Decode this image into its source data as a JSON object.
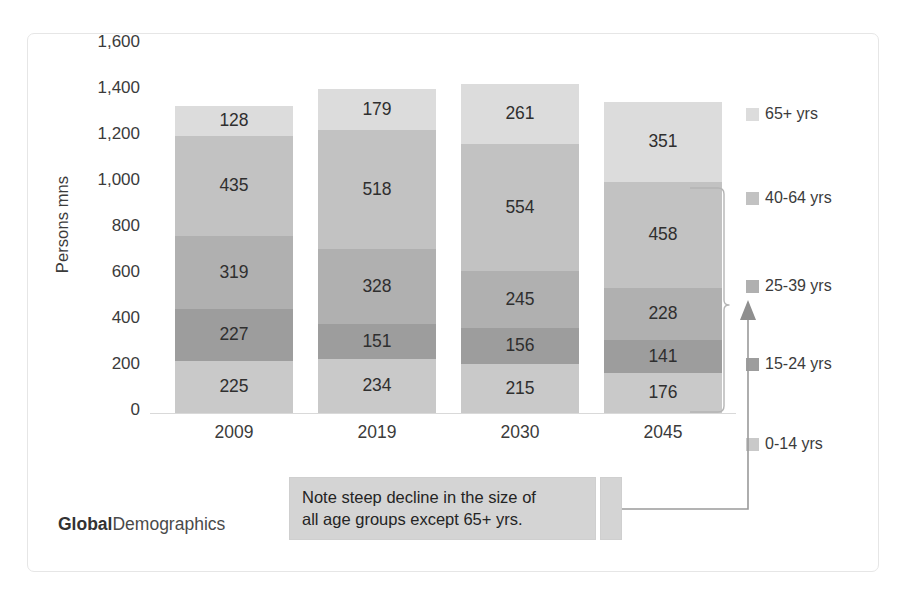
{
  "chart_data": {
    "type": "bar",
    "subtype": "stacked-column",
    "title": "",
    "xlabel": "",
    "ylabel": "Persons mns",
    "ylim": [
      0,
      1600
    ],
    "ytick_step": 200,
    "ytick_labels": [
      "1,600",
      "1,400",
      "1,200",
      "1,000",
      "800",
      "600",
      "400",
      "200",
      "0"
    ],
    "ytick_values": [
      1600,
      1400,
      1200,
      1000,
      800,
      600,
      400,
      200,
      0
    ],
    "grid": false,
    "legend_position": "right",
    "categories": [
      "2009",
      "2019",
      "2030",
      "2045"
    ],
    "stack_order_bottom_to_top": [
      "0-14 yrs",
      "15-24 yrs",
      "25-39 yrs",
      "40-64 yrs",
      "65+ yrs"
    ],
    "series": [
      {
        "name": "0-14 yrs",
        "color": "#c9c9c9",
        "values": [
          225,
          234,
          215,
          176
        ]
      },
      {
        "name": "15-24 yrs",
        "color": "#9d9d9d",
        "values": [
          227,
          151,
          156,
          141
        ]
      },
      {
        "name": "25-39 yrs",
        "color": "#b0b0b0",
        "values": [
          319,
          328,
          245,
          228
        ]
      },
      {
        "name": "40-64 yrs",
        "color": "#c2c2c2",
        "values": [
          435,
          518,
          554,
          458
        ]
      },
      {
        "name": "65+ yrs",
        "color": "#dcdcdc",
        "values": [
          128,
          179,
          261,
          351
        ]
      }
    ],
    "totals": [
      1334,
      1410,
      1431,
      1354
    ],
    "annotations": [
      {
        "text": "Note steep decline in the size of all age groups except 65+ yrs.",
        "points_to": "2045 column, age groups 0-14 through 40-64"
      }
    ]
  },
  "axis": {
    "y_title": "Persons mns"
  },
  "legend": {
    "items": [
      {
        "label": "65+ yrs",
        "color": "#dcdcdc"
      },
      {
        "label": "40-64 yrs",
        "color": "#c2c2c2"
      },
      {
        "label": "25-39 yrs",
        "color": "#b0b0b0"
      },
      {
        "label": "15-24 yrs",
        "color": "#9d9d9d"
      },
      {
        "label": "0-14 yrs",
        "color": "#c9c9c9"
      }
    ]
  },
  "note": {
    "line1": "Note steep decline in the size of",
    "line2": "all age groups except 65+ yrs."
  },
  "brand": {
    "bold_part": "Global",
    "light_part": "Demographics"
  }
}
